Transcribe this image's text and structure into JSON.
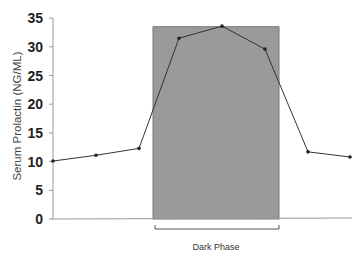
{
  "chart_data": {
    "type": "line",
    "title": "",
    "xlabel": "",
    "ylabel": "Serum Prolactin (NG/ML)",
    "ylim": [
      0,
      35
    ],
    "yticks": [
      0,
      5,
      10,
      15,
      20,
      25,
      30,
      35
    ],
    "grid": false,
    "x": [
      1,
      2,
      3,
      4,
      5,
      6,
      7,
      8
    ],
    "series": [
      {
        "name": "Serum Prolactin",
        "values": [
          10.1,
          11.1,
          12.3,
          31.5,
          33.6,
          29.6,
          11.7,
          10.8
        ]
      }
    ],
    "annotations": [
      {
        "type": "shaded-region",
        "label": "Dark Phase",
        "x_start_index": 3.75,
        "x_end_index": 6.75,
        "top": 33.5,
        "color": "#999999"
      }
    ],
    "colors": {
      "line": "#333333",
      "shade": "#9a9a9a",
      "axis": "#999999"
    }
  },
  "labels": {
    "ylabel": "Serum Prolactin (NG/ML)",
    "dark_phase": "Dark Phase"
  }
}
